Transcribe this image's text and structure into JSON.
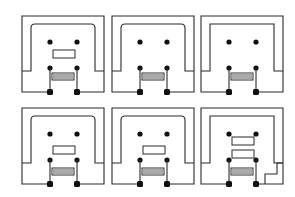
{
  "diagram": {
    "title": "",
    "colors": {
      "line": "#2a2a2a",
      "fill": "#111111",
      "background": "#ffffff"
    },
    "panels": [
      {
        "id": "top-1",
        "row": 1,
        "col": 1,
        "inner_corners": "rounded",
        "rectangles": 1,
        "rect_position": "center",
        "corner_notch": false
      },
      {
        "id": "top-2",
        "row": 1,
        "col": 2,
        "inner_corners": "rounded",
        "rectangles": 0,
        "corner_notch": false
      },
      {
        "id": "top-3",
        "row": 1,
        "col": 3,
        "inner_corners": "square",
        "rectangles": 0,
        "corner_notch": false
      },
      {
        "id": "bottom-1",
        "row": 2,
        "col": 1,
        "inner_corners": "rounded",
        "rectangles": 1,
        "rect_position": "lower",
        "corner_notch": false
      },
      {
        "id": "bottom-2",
        "row": 2,
        "col": 2,
        "inner_corners": "rounded",
        "rectangles": 1,
        "rect_position": "lower",
        "corner_notch": false
      },
      {
        "id": "bottom-3",
        "row": 2,
        "col": 3,
        "inner_corners": "square",
        "rectangles": 2,
        "rect_position": "stacked",
        "corner_notch": true
      }
    ]
  }
}
